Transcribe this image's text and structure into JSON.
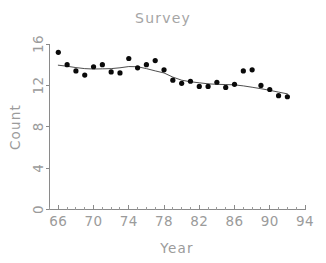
{
  "chart_data": {
    "type": "scatter",
    "title": "Survey",
    "xlabel": "Year",
    "ylabel": "Count",
    "xlim": [
      65,
      94
    ],
    "ylim": [
      0,
      16
    ],
    "grid": false,
    "legend": null,
    "xticks": [
      66,
      70,
      74,
      78,
      82,
      86,
      90,
      94
    ],
    "xtick_labels": [
      "66",
      "70",
      "74",
      "78",
      "82",
      "86",
      "90",
      "94"
    ],
    "xminor_step": 1,
    "yticks": [
      0,
      4,
      8,
      12,
      16
    ],
    "ytick_labels": [
      "0",
      "4",
      "8",
      "12",
      "16"
    ],
    "point_color": "#0a0a0a",
    "line_color": "#3a3a3a",
    "axis_color": "#8a8a8a",
    "text_color": "#9b9b9b",
    "series": [
      {
        "name": "Count",
        "marker": "filled-circle",
        "x": [
          66,
          67,
          68,
          69,
          70,
          71,
          72,
          73,
          74,
          75,
          76,
          77,
          78,
          79,
          80,
          81,
          82,
          83,
          84,
          85,
          86,
          87,
          88,
          89,
          90,
          91,
          92
        ],
        "y": [
          15.2,
          14.0,
          13.4,
          13.0,
          13.8,
          14.0,
          13.3,
          13.2,
          14.6,
          13.7,
          14.0,
          14.4,
          13.5,
          12.5,
          12.2,
          12.4,
          11.9,
          11.9,
          12.3,
          11.8,
          12.1,
          13.4,
          13.5,
          12.0,
          11.6,
          11.0,
          10.9
        ]
      }
    ],
    "trend": {
      "name": "smoothed-fit",
      "x": [
        66,
        67,
        68,
        69,
        70,
        71,
        72,
        73,
        74,
        75,
        76,
        77,
        78,
        79,
        80,
        81,
        82,
        83,
        84,
        85,
        86,
        87,
        88,
        89,
        90,
        91,
        92
      ],
      "y": [
        13.95,
        13.85,
        13.72,
        13.62,
        13.58,
        13.6,
        13.62,
        13.7,
        13.82,
        13.8,
        13.62,
        13.4,
        13.2,
        12.8,
        12.5,
        12.35,
        12.25,
        12.15,
        12.1,
        12.08,
        12.05,
        11.95,
        11.82,
        11.68,
        11.52,
        11.35,
        11.18
      ]
    }
  }
}
